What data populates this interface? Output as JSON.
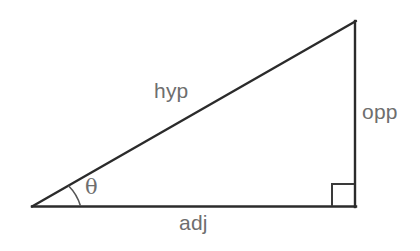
{
  "diagram": {
    "background_color": "#ffffff",
    "stroke_color": "#2b2b2b",
    "label_color": "#6e6e6e",
    "vertices": {
      "left": [
        32,
        207
      ],
      "top_right": [
        356,
        21
      ],
      "bottom_right": [
        356,
        207
      ]
    },
    "labels": {
      "hypotenuse": "hyp",
      "opposite": "opp",
      "adjacent": "adj",
      "angle": "θ"
    },
    "markers": {
      "right_angle": "right-angle-square",
      "angle_arc": "angle-arc"
    }
  }
}
